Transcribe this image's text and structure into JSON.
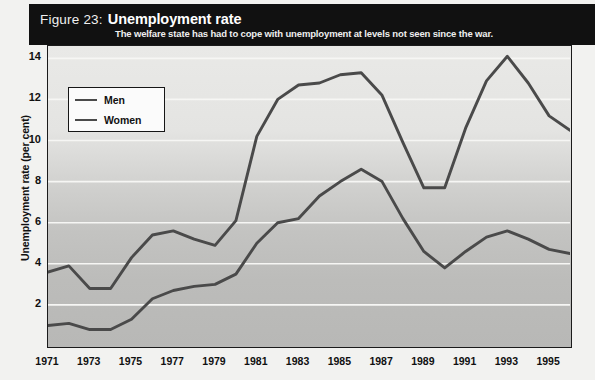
{
  "header": {
    "figure_number": "Figure 23:",
    "title": "Unemployment rate",
    "subtitle": "The welfare state has had to cope with unemployment at levels not seen since the war.",
    "background_color": "#111111",
    "text_color": "#ffffff"
  },
  "legend": {
    "position": "top-left-inside",
    "entries": [
      {
        "label": "Men",
        "color": "#4a4a4a"
      },
      {
        "label": "Women",
        "color": "#4a4a4a"
      }
    ]
  },
  "axes": {
    "y_title": "Unemployment rate (per cent)",
    "y_ticks": [
      "2",
      "4",
      "6",
      "8",
      "10",
      "12",
      "14"
    ],
    "x_ticks": [
      "1971",
      "1973",
      "1975",
      "1977",
      "1979",
      "1981",
      "1983",
      "1985",
      "1987",
      "1989",
      "1991",
      "1993",
      "1995"
    ]
  },
  "chart_data": {
    "type": "line",
    "title": "Unemployment rate",
    "subtitle": "The welfare state has had to cope with unemployment at levels not seen since the war.",
    "xlabel": "",
    "ylabel": "Unemployment rate (per cent)",
    "xlim": [
      1971,
      1996
    ],
    "ylim": [
      0,
      14.6
    ],
    "ytick_values": [
      2,
      4,
      6,
      8,
      10,
      12,
      14
    ],
    "xtick_values": [
      1971,
      1973,
      1975,
      1977,
      1979,
      1981,
      1983,
      1985,
      1987,
      1989,
      1991,
      1993,
      1995
    ],
    "grid": "horizontal-white-lines",
    "legend_position": "upper left",
    "x": [
      1971,
      1972,
      1973,
      1974,
      1975,
      1976,
      1977,
      1978,
      1979,
      1980,
      1981,
      1982,
      1983,
      1984,
      1985,
      1986,
      1987,
      1988,
      1989,
      1990,
      1991,
      1992,
      1993,
      1994,
      1995,
      1996
    ],
    "series": [
      {
        "name": "Men",
        "color": "#4a4a4a",
        "values": [
          3.6,
          3.9,
          2.8,
          2.8,
          4.3,
          5.4,
          5.6,
          5.2,
          4.9,
          6.1,
          10.2,
          12.0,
          12.7,
          12.8,
          13.2,
          13.3,
          12.2,
          9.9,
          7.7,
          7.7,
          10.6,
          12.9,
          14.1,
          12.8,
          11.2,
          10.5
        ]
      },
      {
        "name": "Women",
        "color": "#4a4a4a",
        "values": [
          1.0,
          1.1,
          0.8,
          0.8,
          1.3,
          2.3,
          2.7,
          2.9,
          3.0,
          3.5,
          5.0,
          6.0,
          6.2,
          7.3,
          8.0,
          8.6,
          8.0,
          6.2,
          4.6,
          3.8,
          4.6,
          5.3,
          5.6,
          5.2,
          4.7,
          4.5
        ]
      }
    ]
  },
  "colors": {
    "line": "#4a4a4a",
    "gridline": "#f6f6f4",
    "frame": "#1b1b1b",
    "plot_bg_top": "#e9e9e7",
    "plot_bg_bottom": "#b8b8b6"
  }
}
